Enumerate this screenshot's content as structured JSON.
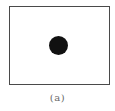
{
  "figure": {
    "caption": "(a)",
    "frame": {
      "shape": "rectangle",
      "stroke_color": "#4a4a4a",
      "fill_color": "#ffffff"
    },
    "marker": {
      "shape": "filled-circle",
      "position": "center",
      "color": "#111111"
    }
  }
}
